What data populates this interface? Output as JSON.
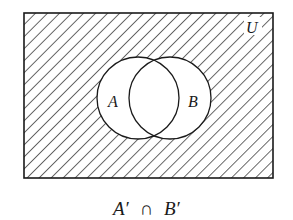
{
  "diagram": {
    "type": "venn",
    "universe_label": "U",
    "sets": [
      {
        "label": "A",
        "shaded": false
      },
      {
        "label": "B",
        "shaded": false
      }
    ],
    "shaded_region": "outside both A and B",
    "caption": {
      "left": "A′",
      "operator": "∩",
      "right": "B′"
    },
    "colors": {
      "stroke": "#1a1a1a",
      "background": "#ffffff"
    }
  }
}
